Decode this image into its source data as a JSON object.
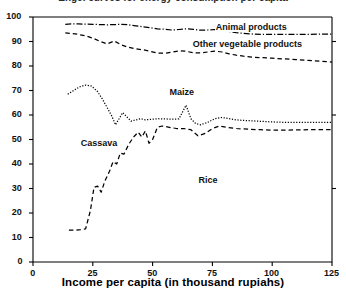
{
  "chart_data": {
    "type": "line",
    "title": "Engel curves for energy consumption per capita",
    "title_clipped": true,
    "xlabel": "Income per capita (in thousand rupiahs)",
    "ylabel": "",
    "xlim": [
      0,
      125
    ],
    "ylim": [
      0,
      100
    ],
    "xticks": [
      0,
      25,
      50,
      75,
      100,
      125
    ],
    "yticks": [
      0,
      10,
      20,
      30,
      40,
      50,
      60,
      70,
      80,
      90,
      100
    ],
    "grid": false,
    "legend_position": "inline-annotations",
    "series": [
      {
        "name": "Animal products",
        "style": "dash-dot",
        "label_x": 92,
        "label_y": 95.5,
        "points": [
          [
            13.5,
            97.0
          ],
          [
            16,
            97.2
          ],
          [
            19,
            97.2
          ],
          [
            22,
            97.1
          ],
          [
            25,
            97.0
          ],
          [
            28,
            96.9
          ],
          [
            31,
            96.8
          ],
          [
            34,
            96.9
          ],
          [
            37,
            97.0
          ],
          [
            40,
            96.8
          ],
          [
            43,
            96.4
          ],
          [
            46,
            96.0
          ],
          [
            49,
            95.6
          ],
          [
            52,
            95.2
          ],
          [
            55,
            95.0
          ],
          [
            58,
            94.7
          ],
          [
            61,
            94.9
          ],
          [
            64,
            95.2
          ],
          [
            67,
            95.0
          ],
          [
            70,
            94.6
          ],
          [
            73,
            94.7
          ],
          [
            76,
            94.9
          ],
          [
            79,
            94.6
          ],
          [
            82,
            94.1
          ],
          [
            85,
            93.6
          ],
          [
            88,
            93.3
          ],
          [
            92,
            93.0
          ],
          [
            96,
            92.9
          ],
          [
            100,
            92.9
          ],
          [
            105,
            92.9
          ],
          [
            110,
            92.9
          ],
          [
            115,
            92.9
          ],
          [
            120,
            93.0
          ],
          [
            125,
            93.0
          ]
        ]
      },
      {
        "name": "Other vegetable products",
        "style": "dashed",
        "label_x": 92,
        "label_y": 88.5,
        "points": [
          [
            13.5,
            93.5
          ],
          [
            16,
            93.3
          ],
          [
            19,
            92.9
          ],
          [
            22,
            92.3
          ],
          [
            25,
            91.4
          ],
          [
            28,
            90.1
          ],
          [
            31,
            89.0
          ],
          [
            34,
            90.2
          ],
          [
            37,
            88.6
          ],
          [
            40,
            87.6
          ],
          [
            43,
            87.0
          ],
          [
            46,
            86.6
          ],
          [
            49,
            86.0
          ],
          [
            52,
            85.3
          ],
          [
            55,
            85.2
          ],
          [
            58,
            85.6
          ],
          [
            61,
            86.2
          ],
          [
            64,
            86.0
          ],
          [
            67,
            85.4
          ],
          [
            70,
            85.3
          ],
          [
            73,
            85.7
          ],
          [
            76,
            86.1
          ],
          [
            79,
            85.7
          ],
          [
            82,
            85.0
          ],
          [
            85,
            84.4
          ],
          [
            88,
            84.0
          ],
          [
            92,
            83.6
          ],
          [
            96,
            83.4
          ],
          [
            100,
            83.2
          ],
          [
            105,
            82.9
          ],
          [
            110,
            82.6
          ],
          [
            115,
            82.3
          ],
          [
            120,
            82.0
          ],
          [
            125,
            81.6
          ]
        ]
      },
      {
        "name": "Maize",
        "style": "dotted",
        "label_x": 62,
        "label_y": 69,
        "points": [
          [
            14.5,
            68.5
          ],
          [
            17,
            70.0
          ],
          [
            19.5,
            71.5
          ],
          [
            22,
            72.2
          ],
          [
            24.5,
            71.8
          ],
          [
            27,
            69.5
          ],
          [
            29,
            66.5
          ],
          [
            31,
            63.0
          ],
          [
            33,
            59.5
          ],
          [
            34.5,
            56.0
          ],
          [
            36,
            58.5
          ],
          [
            37.5,
            61.0
          ],
          [
            39,
            59.5
          ],
          [
            41,
            57.5
          ],
          [
            43,
            58.0
          ],
          [
            45,
            58.5
          ],
          [
            47,
            58.0
          ],
          [
            49,
            58.2
          ],
          [
            52,
            58.5
          ],
          [
            55,
            58.4
          ],
          [
            58,
            58.3
          ],
          [
            61,
            58.4
          ],
          [
            64,
            64.0
          ],
          [
            66,
            58.5
          ],
          [
            68,
            56.5
          ],
          [
            70,
            56.0
          ],
          [
            73,
            57.0
          ],
          [
            76,
            58.5
          ],
          [
            79,
            59.0
          ],
          [
            82,
            58.5
          ],
          [
            85,
            58.0
          ],
          [
            88,
            57.8
          ],
          [
            92,
            57.6
          ],
          [
            96,
            57.4
          ],
          [
            100,
            57.2
          ],
          [
            105,
            57.0
          ],
          [
            110,
            57.0
          ],
          [
            115,
            57.0
          ],
          [
            120,
            57.0
          ],
          [
            125,
            57.0
          ]
        ]
      },
      {
        "name": "Cassava",
        "style": "dashed",
        "label_x": 27,
        "label_y": 48,
        "points": [
          [
            15,
            13.0
          ],
          [
            18,
            13.0
          ],
          [
            20,
            13.2
          ],
          [
            22,
            13.5
          ],
          [
            24,
            21.0
          ],
          [
            25.5,
            30.5
          ],
          [
            27,
            31.0
          ],
          [
            28.5,
            28.5
          ],
          [
            30,
            33.0
          ],
          [
            32,
            37.0
          ],
          [
            33.5,
            41.0
          ],
          [
            35,
            40.0
          ],
          [
            36.5,
            44.5
          ],
          [
            38,
            44.0
          ],
          [
            40,
            48.0
          ],
          [
            42,
            51.0
          ],
          [
            44,
            53.0
          ],
          [
            45.5,
            51.0
          ],
          [
            47,
            53.5
          ],
          [
            48.5,
            48.5
          ],
          [
            50,
            50.0
          ],
          [
            52,
            55.0
          ],
          [
            54,
            55.5
          ],
          [
            57,
            55.0
          ],
          [
            60,
            54.5
          ],
          [
            63,
            54.5
          ],
          [
            66,
            54.0
          ],
          [
            69,
            51.5
          ],
          [
            72,
            52.5
          ],
          [
            75,
            54.5
          ],
          [
            78,
            55.5
          ],
          [
            81,
            55.0
          ],
          [
            85,
            54.5
          ],
          [
            90,
            54.2
          ],
          [
            95,
            54.0
          ],
          [
            100,
            53.8
          ],
          [
            105,
            53.8
          ],
          [
            110,
            53.9
          ],
          [
            115,
            54.0
          ],
          [
            120,
            54.0
          ],
          [
            125,
            54.0
          ]
        ]
      },
      {
        "name": "Rice",
        "style": "dashed",
        "label_x": 73,
        "label_y": 33,
        "is_label_only": true
      }
    ],
    "annotations": [
      {
        "text": "Animal products",
        "x": 92,
        "y": 95.5
      },
      {
        "text": "Other vegetable products",
        "x": 92,
        "y": 88.5
      },
      {
        "text": "Maize",
        "x": 62,
        "y": 69
      },
      {
        "text": "Cassava",
        "x": 27,
        "y": 48
      },
      {
        "text": "Rice",
        "x": 73,
        "y": 33
      }
    ],
    "colors": {
      "line": "#000000",
      "background": "#ffffff",
      "axis": "#000000"
    }
  }
}
